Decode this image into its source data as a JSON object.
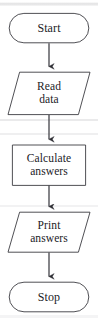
{
  "diagram": {
    "type": "flowchart",
    "orientation": "top-to-bottom",
    "background_color": "#ffffff",
    "stroke_color": "#3c3c42",
    "text_color": "#1b1b1f",
    "nodes": [
      {
        "id": "start",
        "shape": "terminator",
        "label": "Start",
        "lines": [
          "Start"
        ]
      },
      {
        "id": "read-data",
        "shape": "parallelogram",
        "label": "Read data",
        "lines": [
          "Read",
          "data"
        ]
      },
      {
        "id": "calculate-answers",
        "shape": "rectangle",
        "label": "Calculate answers",
        "lines": [
          "Calculate",
          "answers"
        ]
      },
      {
        "id": "print-answers",
        "shape": "parallelogram",
        "label": "Print answers",
        "lines": [
          "Print",
          "answers"
        ]
      },
      {
        "id": "stop",
        "shape": "terminator",
        "label": "Stop",
        "lines": [
          "Stop"
        ]
      }
    ],
    "connectors": [
      {
        "id": "start-to-read",
        "from": "start",
        "to": "read-data",
        "arrow": "down"
      },
      {
        "id": "read-to-calculate",
        "from": "read-data",
        "to": "calculate-answers",
        "arrow": "down"
      },
      {
        "id": "calculate-to-print",
        "from": "calculate-answers",
        "to": "print-answers",
        "arrow": "down"
      },
      {
        "id": "print-to-stop",
        "from": "print-answers",
        "to": "stop",
        "arrow": "down"
      }
    ]
  }
}
